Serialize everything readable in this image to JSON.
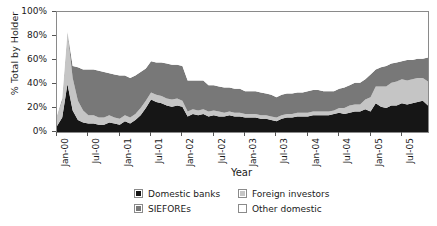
{
  "chart_data": {
    "type": "area",
    "stacked": true,
    "title": "",
    "xlabel": "Year",
    "ylabel": "% Total by Holder",
    "ylim": [
      0,
      100
    ],
    "ytick_labels": [
      "0%",
      "20%",
      "40%",
      "60%",
      "80%",
      "100%"
    ],
    "ytick_values": [
      0,
      20,
      40,
      60,
      80,
      100
    ],
    "grid": false,
    "legend_position": "bottom",
    "xtick_labels": [
      "Jan-00",
      "Jul-00",
      "Jan-01",
      "Jul-01",
      "Jan-02",
      "Jul-02",
      "Jan-03",
      "Jul-03",
      "Jan-04",
      "Jul-04",
      "Jan-05",
      "Jul-05"
    ],
    "xtick_indices": [
      0,
      6,
      12,
      18,
      24,
      30,
      36,
      42,
      48,
      54,
      60,
      66
    ],
    "x": [
      "Jan-00",
      "Feb-00",
      "Mar-00",
      "Apr-00",
      "May-00",
      "Jun-00",
      "Jul-00",
      "Aug-00",
      "Sep-00",
      "Oct-00",
      "Nov-00",
      "Dec-00",
      "Jan-01",
      "Feb-01",
      "Mar-01",
      "Apr-01",
      "May-01",
      "Jun-01",
      "Jul-01",
      "Aug-01",
      "Sep-01",
      "Oct-01",
      "Nov-01",
      "Dec-01",
      "Jan-02",
      "Feb-02",
      "Mar-02",
      "Apr-02",
      "May-02",
      "Jun-02",
      "Jul-02",
      "Aug-02",
      "Sep-02",
      "Oct-02",
      "Nov-02",
      "Dec-02",
      "Jan-03",
      "Feb-03",
      "Mar-03",
      "Apr-03",
      "May-03",
      "Jun-03",
      "Jul-03",
      "Aug-03",
      "Sep-03",
      "Oct-03",
      "Nov-03",
      "Dec-03",
      "Jan-04",
      "Feb-04",
      "Mar-04",
      "Apr-04",
      "May-04",
      "Jun-04",
      "Jul-04",
      "Aug-04",
      "Sep-04",
      "Oct-04",
      "Nov-04",
      "Dec-04",
      "Jan-05",
      "Feb-05",
      "Mar-05",
      "Apr-05",
      "May-05",
      "Jun-05",
      "Jul-05",
      "Aug-05",
      "Sep-05",
      "Oct-05",
      "Nov-05",
      "Dec-05"
    ],
    "series": [
      {
        "name": "Domestic banks",
        "color": "#161616",
        "values": [
          5,
          12,
          40,
          18,
          10,
          8,
          7,
          7,
          6,
          6,
          8,
          7,
          6,
          9,
          7,
          10,
          14,
          20,
          27,
          25,
          24,
          22,
          21,
          22,
          21,
          13,
          15,
          14,
          15,
          13,
          14,
          13,
          13,
          14,
          13,
          13,
          12,
          12,
          12,
          11,
          11,
          10,
          9,
          11,
          12,
          12,
          13,
          13,
          13,
          14,
          14,
          14,
          14,
          15,
          16,
          15,
          16,
          17,
          17,
          19,
          17,
          24,
          21,
          20,
          22,
          22,
          24,
          23,
          24,
          25,
          26,
          22
        ]
      },
      {
        "name": "Foreign investors",
        "color": "#c5c5c5",
        "values": [
          9,
          14,
          44,
          27,
          16,
          10,
          7,
          7,
          6,
          6,
          6,
          5,
          5,
          5,
          5,
          5,
          6,
          6,
          6,
          6,
          6,
          6,
          6,
          6,
          5,
          4,
          4,
          4,
          4,
          4,
          4,
          4,
          3,
          3,
          3,
          3,
          3,
          3,
          3,
          3,
          3,
          3,
          3,
          3,
          3,
          3,
          3,
          3,
          3,
          3,
          3,
          3,
          3,
          3,
          4,
          5,
          6,
          6,
          6,
          8,
          12,
          14,
          17,
          18,
          19,
          20,
          20,
          20,
          20,
          20,
          19,
          20
        ]
      },
      {
        "name": "SIEFOREs",
        "color": "#787878",
        "values": [
          0,
          2,
          0,
          10,
          28,
          34,
          38,
          38,
          39,
          38,
          35,
          36,
          36,
          33,
          33,
          32,
          30,
          27,
          26,
          27,
          28,
          29,
          29,
          28,
          29,
          26,
          24,
          25,
          24,
          22,
          21,
          21,
          21,
          20,
          20,
          20,
          19,
          19,
          19,
          19,
          18,
          18,
          17,
          17,
          17,
          17,
          17,
          17,
          18,
          18,
          18,
          17,
          17,
          16,
          16,
          17,
          17,
          18,
          18,
          17,
          19,
          14,
          16,
          17,
          16,
          16,
          15,
          17,
          16,
          16,
          16,
          20
        ]
      },
      {
        "name": "Other domestic",
        "color": "#ffffff",
        "values": [
          86,
          72,
          16,
          45,
          46,
          48,
          48,
          48,
          49,
          50,
          51,
          52,
          53,
          53,
          55,
          53,
          50,
          47,
          41,
          42,
          42,
          43,
          44,
          44,
          45,
          57,
          57,
          57,
          57,
          61,
          61,
          62,
          63,
          63,
          64,
          64,
          66,
          66,
          66,
          67,
          68,
          69,
          71,
          69,
          68,
          68,
          67,
          67,
          66,
          65,
          65,
          66,
          66,
          66,
          64,
          63,
          61,
          59,
          59,
          56,
          52,
          48,
          46,
          45,
          43,
          42,
          41,
          40,
          40,
          39,
          39,
          38
        ]
      }
    ]
  },
  "legend": {
    "entries": [
      {
        "label": "Domestic banks",
        "color": "#161616"
      },
      {
        "label": "Foreign investors",
        "color": "#c5c5c5"
      },
      {
        "label": "SIEFOREs",
        "color": "#787878"
      },
      {
        "label": "Other domestic",
        "color": "#ffffff"
      }
    ]
  }
}
